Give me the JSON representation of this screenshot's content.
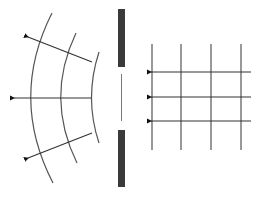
{
  "diagram": {
    "colors": {
      "background": "#ffffff",
      "barrier": "#3a3a3a",
      "lines": "#555555",
      "arrows": "#111111"
    },
    "barrier": {
      "x": 118,
      "width": 7,
      "top_segment": {
        "y1": 9,
        "y2": 67
      },
      "bottom_segment": {
        "y1": 130,
        "y2": 187
      },
      "slit_line": {
        "x": 121,
        "y1": 74,
        "y2": 121
      }
    },
    "incident_wave": {
      "wavefront_x": [
        152,
        181,
        211,
        241
      ],
      "wavefront_y_range": [
        44,
        150
      ],
      "rays_y": [
        72,
        97,
        121
      ],
      "ray_start_x": 251,
      "ray_tip_x": 145,
      "direction": "left"
    },
    "diffracted_wave": {
      "wavefronts": [
        {
          "top": [
            52,
            13
          ],
          "mid": [
            30,
            98
          ],
          "bottom": [
            53,
            183
          ]
        },
        {
          "top": [
            76,
            33
          ],
          "mid": [
            60,
            98
          ],
          "bottom": [
            77,
            163
          ]
        },
        {
          "top": [
            99,
            52
          ],
          "mid": [
            91,
            98
          ],
          "bottom": [
            99,
            143
          ]
        }
      ],
      "rays": [
        {
          "from": [
            92,
            62
          ],
          "tip": [
            22,
            35
          ]
        },
        {
          "from": [
            91,
            98
          ],
          "tip": [
            8,
            98
          ]
        },
        {
          "from": [
            92,
            133
          ],
          "tip": [
            22,
            160
          ]
        }
      ]
    }
  }
}
